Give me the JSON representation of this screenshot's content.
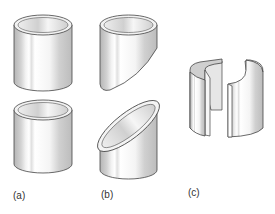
{
  "figure": {
    "labels": {
      "a": "(a)",
      "b": "(b)",
      "c": "(c)"
    },
    "colors": {
      "outline": "#444444",
      "shade": "#bdbdbd",
      "light": "#f4f4f4",
      "inner": "#d6d6d6"
    }
  }
}
